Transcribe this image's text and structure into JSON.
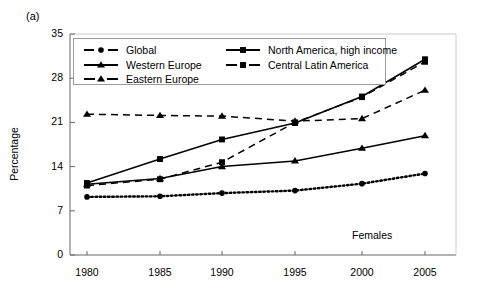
{
  "panel_label": "(a)",
  "annotation": "Females",
  "axis": {
    "ylabel": "Percentage",
    "yticks": [
      0,
      7,
      14,
      21,
      28,
      35
    ],
    "xticks": [
      "1980",
      "1985",
      "1990",
      "1995",
      "2000",
      "2005"
    ]
  },
  "legend": {
    "entries": [
      {
        "label": "Global",
        "marker": "circle",
        "line": "dotted"
      },
      {
        "label": "Western Europe",
        "marker": "triangle",
        "line": "solid"
      },
      {
        "label": "Eastern Europe",
        "marker": "triangle",
        "line": "dashed"
      },
      {
        "label": "North America, high income",
        "marker": "square",
        "line": "solid"
      },
      {
        "label": "Central Latin America",
        "marker": "square",
        "line": "dashed"
      }
    ]
  },
  "chart_data": {
    "type": "line",
    "title": "",
    "subtitle": "Females",
    "xlabel": "",
    "ylabel": "Percentage",
    "x": [
      1980,
      1985,
      1990,
      1995,
      2000,
      2005
    ],
    "xtick_labels": [
      "1980",
      "1985",
      "1990",
      "1995",
      "2000",
      "2005"
    ],
    "ytick_labels": [
      "0",
      "7",
      "14",
      "21",
      "28",
      "35"
    ],
    "xlim": [
      1978,
      2007
    ],
    "ylim": [
      0,
      35
    ],
    "grid": false,
    "legend_position": "top-inside",
    "annotations": [
      "(a)",
      "Females"
    ],
    "series": [
      {
        "name": "Global",
        "marker": "circle",
        "line": "dotted",
        "values": [
          9.2,
          9.3,
          9.8,
          10.2,
          11.3,
          12.9
        ]
      },
      {
        "name": "Western Europe",
        "marker": "triangle",
        "line": "solid",
        "values": [
          11.2,
          12.1,
          14.0,
          14.9,
          16.9,
          18.9
        ]
      },
      {
        "name": "Eastern Europe",
        "marker": "triangle",
        "line": "dashed",
        "values": [
          22.3,
          22.1,
          22.0,
          21.2,
          21.6,
          26.1
        ]
      },
      {
        "name": "North America, high income",
        "marker": "square",
        "line": "solid",
        "values": [
          11.4,
          15.2,
          18.3,
          20.9,
          25.1,
          31.0
        ]
      },
      {
        "name": "Central Latin America",
        "marker": "square",
        "line": "dashed",
        "values": [
          11.0,
          12.0,
          14.7,
          21.0,
          25.0,
          30.6
        ]
      }
    ]
  }
}
